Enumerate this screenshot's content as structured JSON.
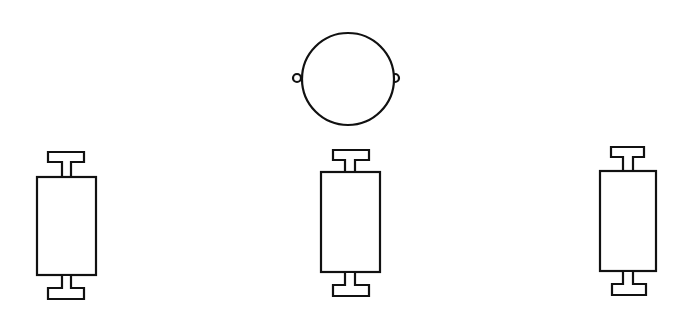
{
  "diagram": {
    "background": "#ffffff",
    "stroke_color": "#111111",
    "elements": [
      {
        "id": "circle-node",
        "type": "circle-with-side-loops",
        "cx": 348,
        "cy": 79,
        "r": 45,
        "loop_r": 4
      },
      {
        "id": "left-roller",
        "type": "t-capped-rectangle",
        "rect": [
          37,
          177,
          59,
          98
        ]
      },
      {
        "id": "middle-roller",
        "type": "t-capped-rectangle",
        "rect": [
          321,
          172,
          59,
          100
        ]
      },
      {
        "id": "right-roller",
        "type": "t-capped-rectangle",
        "rect": [
          600,
          171,
          56,
          100
        ]
      }
    ]
  }
}
